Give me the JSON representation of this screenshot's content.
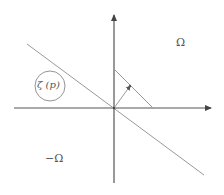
{
  "diagram": {
    "labels": {
      "omega": "Ω",
      "neg_omega": "−Ω",
      "zeta_p": "ζ (p)"
    },
    "colors": {
      "axis": "#555555",
      "line": "#999999",
      "circle": "#888888",
      "text": "#555555"
    },
    "elements": [
      {
        "type": "axis",
        "name": "x-axis",
        "from": [
          14,
          108
        ],
        "to": [
          212,
          108
        ],
        "arrow": true
      },
      {
        "type": "axis",
        "name": "y-axis",
        "from": [
          114,
          183
        ],
        "to": [
          114,
          14
        ],
        "arrow": true
      },
      {
        "type": "line",
        "name": "separating-hyperplane",
        "from": [
          27,
          44
        ],
        "to": [
          204,
          175
        ]
      },
      {
        "type": "line",
        "name": "parallel-segment",
        "from": [
          114,
          69
        ],
        "to": [
          153,
          108
        ]
      },
      {
        "type": "vector",
        "name": "normal-vector",
        "from": [
          114,
          108
        ],
        "to": [
          130,
          86
        ]
      },
      {
        "type": "circle",
        "name": "zeta-circle",
        "center": [
          50,
          86
        ],
        "radius": 15
      }
    ]
  }
}
